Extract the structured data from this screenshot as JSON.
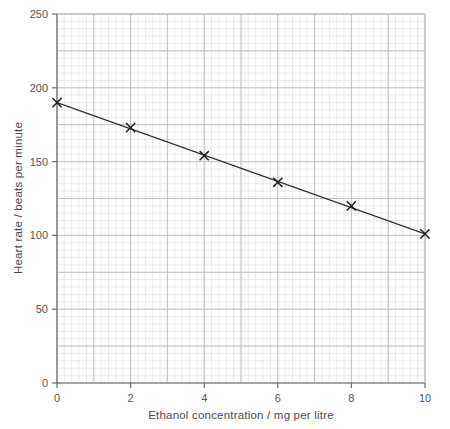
{
  "chart_data": {
    "type": "line",
    "title": "",
    "subtitle": "",
    "xlabel": "Ethanol concentration / mg per litre",
    "ylabel": "Heart rate / beats per minute",
    "xlim": [
      0,
      10
    ],
    "ylim": [
      0,
      250
    ],
    "xticks": [
      0,
      2,
      4,
      6,
      8,
      10
    ],
    "yticks": [
      0,
      50,
      100,
      150,
      200,
      250
    ],
    "xtick_labels": [
      "0",
      "2",
      "4",
      "6",
      "8",
      "10"
    ],
    "ytick_labels": [
      "0",
      "50",
      "100",
      "150",
      "200",
      "250"
    ],
    "x_minor_step": 0.2,
    "y_minor_step": 5,
    "grid": "major-and-minor",
    "legend": "none",
    "marker": "x-cross",
    "series": [
      {
        "name": "Heart rate vs ethanol concentration",
        "x": [
          0,
          2,
          4,
          6,
          8,
          10
        ],
        "values": [
          190,
          173,
          154,
          136,
          120,
          101
        ],
        "points": [
          {
            "x": 0,
            "y": 190
          },
          {
            "x": 2,
            "y": 173
          },
          {
            "x": 4,
            "y": 154
          },
          {
            "x": 6,
            "y": 136
          },
          {
            "x": 8,
            "y": 120
          },
          {
            "x": 10,
            "y": 101
          }
        ],
        "trend_line": {
          "x_start": 0,
          "y_start": 190,
          "x_end": 10,
          "y_end": 101
        }
      }
    ],
    "colors": {
      "line": "#2b2b2f",
      "marker": "#1d1d20",
      "axis": "#6b6b70",
      "major_grid": "#b9b9c2",
      "minor_grid": "#dcdce3",
      "text": "#4a4a4f",
      "background": "#ffffff"
    }
  }
}
